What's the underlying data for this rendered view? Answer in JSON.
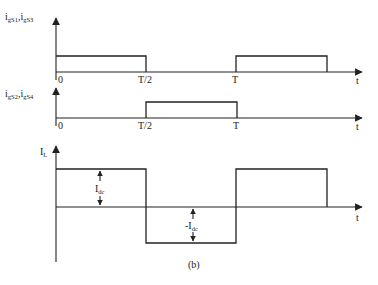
{
  "figure": {
    "caption": "(b)",
    "colors": {
      "line": "#222222",
      "background": "#ffffff"
    }
  },
  "panels": [
    {
      "id": "gate-s1-s3",
      "ylabel_main": "i",
      "ylabel_parts": [
        {
          "base": "i",
          "sub": "gS1"
        },
        {
          "base": "i",
          "sub": "gS3"
        }
      ],
      "ylabel_text": "igS1,igS3",
      "xlabel": "t",
      "ticks": [
        "0",
        "T/2",
        "T"
      ]
    },
    {
      "id": "gate-s2-s4",
      "ylabel_parts": [
        {
          "base": "i",
          "sub": "gS2"
        },
        {
          "base": "i",
          "sub": "gS4"
        }
      ],
      "ylabel_text": "igS2,igS4",
      "xlabel": "t",
      "ticks": [
        "0",
        "T/2",
        "T"
      ]
    },
    {
      "id": "inductor-current",
      "ylabel_parts": [
        {
          "base": "I",
          "sub": "L"
        }
      ],
      "ylabel_text": "IL",
      "xlabel": "t",
      "annotations": [
        {
          "base": "I",
          "sub": "dc"
        },
        {
          "base": "-I",
          "sub": "dc"
        }
      ]
    }
  ],
  "labels": {
    "p1_y_base1": "i",
    "p1_y_sub1": "gS1",
    "p1_comma": ",",
    "p1_y_base2": "i",
    "p1_y_sub2": "gS3",
    "p2_y_base1": "i",
    "p2_y_sub1": "gS2",
    "p2_comma": ",",
    "p2_y_base2": "i",
    "p2_y_sub2": "gS4",
    "p3_y_base": "I",
    "p3_y_sub": "L",
    "t": "t",
    "zero": "0",
    "half_period": "T/2",
    "period": "T",
    "idc_base": "I",
    "idc_sub": "dc",
    "neg_idc_base": "-I",
    "neg_idc_sub": "dc",
    "caption": "(b)"
  }
}
